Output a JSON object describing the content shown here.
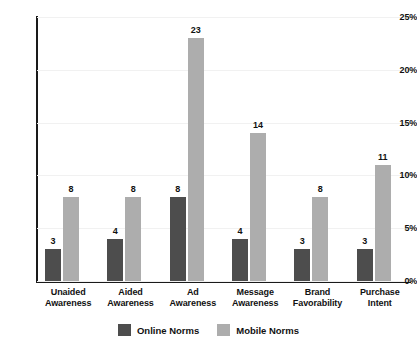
{
  "chart_data": {
    "type": "bar",
    "title": "",
    "xlabel": "",
    "ylabel": "",
    "ylim": [
      0,
      25
    ],
    "grid": true,
    "legend_position": "bottom-center",
    "y_ticks": [
      "0%",
      "5%",
      "10%",
      "15%",
      "20%",
      "25%"
    ],
    "y_tick_values": [
      0,
      5,
      10,
      15,
      20,
      25
    ],
    "categories": [
      "Unaided Awareness",
      "Aided Awareness",
      "Ad Awareness",
      "Message Awareness",
      "Brand Favorability",
      "Purchase Intent"
    ],
    "category_lines": [
      [
        "Unaided",
        "Awareness"
      ],
      [
        "Aided",
        "Awareness"
      ],
      [
        "Ad",
        "Awareness"
      ],
      [
        "Message",
        "Awareness"
      ],
      [
        "Brand",
        "Favorability"
      ],
      [
        "Purchase",
        "Intent"
      ]
    ],
    "series": [
      {
        "name": "Online Norms",
        "color": "#4d4d4d",
        "values": [
          3,
          4,
          8,
          4,
          3,
          3
        ],
        "labels": [
          "3",
          "4",
          "8",
          "4",
          "3",
          "3"
        ]
      },
      {
        "name": "Mobile Norms",
        "color": "#adadad",
        "values": [
          8,
          8,
          23,
          14,
          8,
          11
        ],
        "labels": [
          "8",
          "8",
          "23",
          "14",
          "8",
          "11"
        ]
      }
    ]
  },
  "legend": {
    "items": [
      {
        "label": "Online Norms",
        "color": "#4d4d4d"
      },
      {
        "label": "Mobile Norms",
        "color": "#adadad"
      }
    ]
  },
  "colors": {
    "online_norms": "#4d4d4d",
    "mobile_norms": "#adadad",
    "axis": "#1a1a1a",
    "gridline": "#f1f1f1",
    "background": "#ffffff",
    "text": "#111111"
  }
}
